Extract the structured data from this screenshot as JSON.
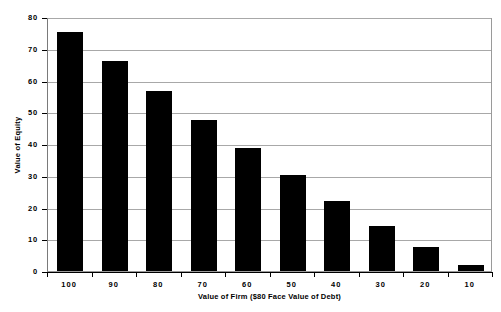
{
  "chart_data": {
    "type": "bar",
    "title": "",
    "subtitle": "",
    "xlabel": "Value of Firm ($80 Face Value of Debt)",
    "ylabel": "Value of Equity",
    "categories": [
      "100",
      "90",
      "80",
      "70",
      "60",
      "50",
      "40",
      "30",
      "20",
      "10"
    ],
    "values": [
      76,
      66.6,
      57.3,
      48,
      39,
      30.5,
      22.2,
      14.2,
      7.6,
      2
    ],
    "series": [
      {
        "name": "Value of Equity",
        "values": [
          76,
          66.6,
          57.3,
          48,
          39,
          30.5,
          22.2,
          14.2,
          7.6,
          2
        ],
        "color": "#000000"
      }
    ],
    "ylim": [
      0,
      80
    ],
    "y_ticks": [
      "0",
      "10",
      "20",
      "30",
      "40",
      "50",
      "60",
      "70",
      "80"
    ],
    "y_tick_values": [
      0,
      10,
      20,
      30,
      40,
      50,
      60,
      70,
      80
    ],
    "grid": true,
    "grid_axis": "y",
    "legend": false,
    "legend_position": "none",
    "bar_color": "#000000",
    "plot_border_color": "#9a9a9a",
    "gridline_color": "#a8a8a8",
    "background_color": "#ffffff",
    "axis_color": "#000000"
  }
}
